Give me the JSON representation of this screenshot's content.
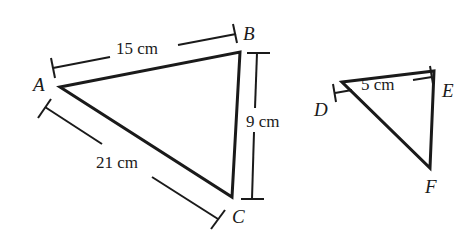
{
  "figure": {
    "large_triangle": {
      "vertices": {
        "A": "A",
        "B": "B",
        "C": "C"
      },
      "sides": {
        "AB": "15 cm",
        "BC": "9 cm",
        "AC": "21 cm"
      }
    },
    "small_triangle": {
      "vertices": {
        "D": "D",
        "E": "E",
        "F": "F"
      },
      "sides": {
        "DE": "5 cm"
      }
    },
    "colors": {
      "stroke": "#1a1a1a",
      "background": "#ffffff"
    }
  }
}
